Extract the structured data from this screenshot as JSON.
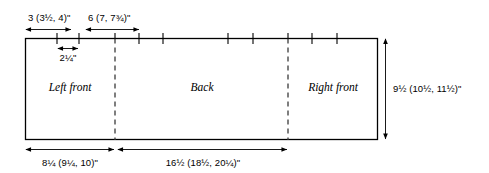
{
  "diagram": {
    "type": "technical-dimension-diagram",
    "units": "inches",
    "ink_color": "#000000",
    "dashed_color": "#3a3a3a",
    "background": "#ffffff"
  },
  "top_dimensions": [
    {
      "id": "top-dim-1",
      "label": "3 (3½, 4)\"",
      "whole": "3",
      "parenthetical": "(3½, 4)",
      "sizes": [
        "3",
        "3½",
        "4"
      ]
    },
    {
      "id": "top-dim-2",
      "label": "6 (7, 7¾)\"",
      "whole": "6",
      "parenthetical": "(7, 7¾)",
      "sizes": [
        "6",
        "7",
        "7¾"
      ]
    }
  ],
  "inner_dimension": {
    "id": "inner-dim-notch",
    "label": "2¼\"",
    "sizes": [
      "2¼"
    ]
  },
  "right_dimension": {
    "id": "right-dim-height",
    "label": "9½ (10½, 11½)\"",
    "whole": "9½",
    "parenthetical": "(10½, 11½)",
    "sizes": [
      "9½",
      "10½",
      "11½"
    ]
  },
  "bottom_dimensions": [
    {
      "id": "bottom-dim-1",
      "label": "8¼ (9¼, 10)\"",
      "whole": "8¼",
      "parenthetical": "(9¼, 10)",
      "sizes": [
        "8¼",
        "9¼",
        "10"
      ]
    },
    {
      "id": "bottom-dim-2",
      "label": "16½ (18½, 20¼)\"",
      "whole": "16½",
      "parenthetical": "(18½, 20¼)",
      "sizes": [
        "16½",
        "18½",
        "20¼"
      ]
    }
  ],
  "panels": [
    {
      "id": "panel-left-front",
      "label": "Left front"
    },
    {
      "id": "panel-back",
      "label": "Back"
    },
    {
      "id": "panel-right-front",
      "label": "Right front"
    }
  ],
  "tick_marks": {
    "count": 10,
    "positions_px": [
      57,
      79,
      115,
      139,
      163,
      228,
      253,
      288,
      312,
      337
    ]
  },
  "dividers": {
    "count": 2,
    "positions_px": [
      115,
      288
    ],
    "style": "dashed"
  }
}
